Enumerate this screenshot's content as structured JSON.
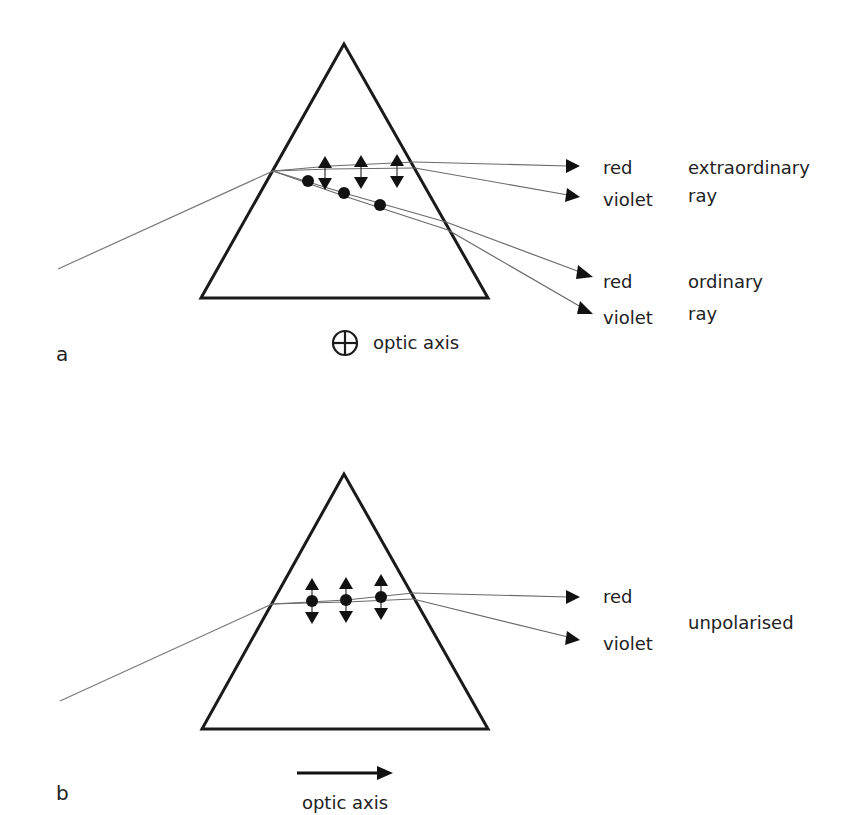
{
  "figure": {
    "panels": [
      {
        "id": "a",
        "part_label": "a",
        "optic_axis_label": "optic axis",
        "optic_axis_orientation": "perpendicular to page (circled cross symbol)",
        "ray_groups": [
          {
            "name": "extraordinary ray",
            "label_line1": "extraordinary",
            "label_line2": "ray",
            "polarisation": "in-plane (double-headed arrows)",
            "colors": [
              "red",
              "violet"
            ]
          },
          {
            "name": "ordinary ray",
            "label_line1": "ordinary",
            "label_line2": "ray",
            "polarisation": "perpendicular to page (dots)",
            "colors": [
              "red",
              "violet"
            ]
          }
        ],
        "labels": {
          "e_red": "red",
          "e_violet": "violet",
          "o_red": "red",
          "o_violet": "violet",
          "extraordinary": "extraordinary",
          "extraordinary_ray": "ray",
          "ordinary": "ordinary",
          "ordinary_ray": "ray"
        }
      },
      {
        "id": "b",
        "part_label": "b",
        "optic_axis_label": "optic axis",
        "optic_axis_orientation": "horizontal arrow pointing right",
        "ray_groups": [
          {
            "name": "unpolarised",
            "label_line1": "unpolarised",
            "polarisation": "both (dots with double-headed arrows)",
            "colors": [
              "red",
              "violet"
            ]
          }
        ],
        "labels": {
          "red": "red",
          "violet": "violet",
          "unpolarised": "unpolarised"
        }
      }
    ]
  }
}
